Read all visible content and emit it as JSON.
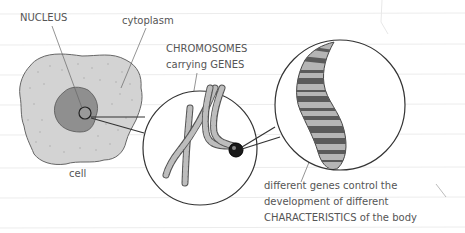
{
  "diagram": {
    "labels": {
      "nucleus": "NUCLEUS",
      "cytoplasm": "cytoplasm",
      "cell": "cell",
      "chromosomes_line1": "CHROMOSOMES",
      "chromosomes_line2": "carrying GENES",
      "genes_line1": "different genes control the",
      "genes_line2": "development of different",
      "genes_line3": "CHARACTERISTICS of the body"
    },
    "parts": [
      {
        "id": "cell",
        "shape": "irregular blob",
        "fill": "#d3d3d3",
        "description": "cell body with speckled cytoplasm"
      },
      {
        "id": "nucleus",
        "shape": "irregular blob",
        "fill": "#8f8f8f",
        "description": "nucleus inside cell"
      },
      {
        "id": "zoom-circle-1",
        "description": "magnified view of nucleus showing X-shaped chromosomes"
      },
      {
        "id": "zoom-circle-2",
        "description": "magnified view of a single chromosome with banded genes"
      }
    ],
    "colors": {
      "line": "#333333",
      "cell_fill": "#d3d3d3",
      "nucleus_fill": "#8f8f8f",
      "band_dark": "#5a5a5a",
      "band_light": "#b5b5b5",
      "text": "#555555",
      "ruled_line": "#ececec"
    }
  }
}
